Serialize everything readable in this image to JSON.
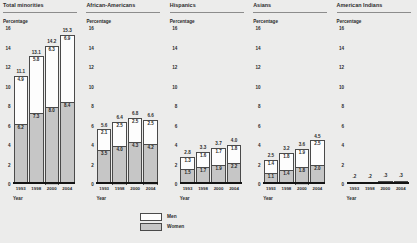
{
  "legend": {
    "items": [
      {
        "label": "Men",
        "color": "#fdfdfd"
      },
      {
        "label": "Women",
        "color": "#c6c6c6"
      }
    ]
  },
  "axis": {
    "y_title": "Percentage",
    "x_title": "Year",
    "yticks": [
      "16",
      "14",
      "12",
      "10",
      "8",
      "6",
      "4",
      "2",
      "0"
    ],
    "ylim": [
      0,
      16
    ],
    "categories": [
      "1993",
      "1998",
      "2000",
      "2004"
    ]
  },
  "chart_data": {
    "type": "bar",
    "title": "",
    "xlabel": "Year",
    "ylabel": "Percentage",
    "ylim": [
      0,
      16
    ],
    "grid": false,
    "legend_position": "bottom-center",
    "stacked": true,
    "categories": [
      "1993",
      "1998",
      "2000",
      "2004"
    ],
    "panels": [
      {
        "title": "Total minorities",
        "totals": [
          11.1,
          13.1,
          14.2,
          15.3
        ],
        "total_labels": [
          "11.1",
          "13.1",
          "14.2",
          "15.3"
        ],
        "series": [
          {
            "name": "Men",
            "values": [
              4.9,
              5.8,
              6.3,
              6.9
            ],
            "labels": [
              "4.9",
              "5.8",
              "6.3",
              "6.9"
            ]
          },
          {
            "name": "Women",
            "values": [
              6.2,
              7.3,
              8.0,
              8.4
            ],
            "labels": [
              "6.2",
              "7.3",
              "8.0",
              "8.4"
            ]
          }
        ]
      },
      {
        "title": "African-Americans",
        "totals": [
          5.6,
          6.4,
          6.8,
          6.6
        ],
        "total_labels": [
          "5.6",
          "6.4",
          "6.8",
          "6.6"
        ],
        "series": [
          {
            "name": "Men",
            "values": [
              2.1,
              2.5,
              2.5,
              2.5
            ],
            "labels": [
              "2.1",
              "2.5",
              "2.5",
              "2.5"
            ]
          },
          {
            "name": "Women",
            "values": [
              3.5,
              4.0,
              4.3,
              4.2
            ],
            "labels": [
              "3.5",
              "4.0",
              "4.3",
              "4.2"
            ]
          }
        ]
      },
      {
        "title": "Hispanics",
        "totals": [
          2.8,
          3.3,
          3.7,
          4.0
        ],
        "total_labels": [
          "2.8",
          "3.3",
          "3.7",
          "4.0"
        ],
        "series": [
          {
            "name": "Men",
            "values": [
              1.3,
              1.6,
              1.7,
              1.8
            ],
            "labels": [
              "1.3",
              "1.6",
              "1.7",
              "1.8"
            ]
          },
          {
            "name": "Women",
            "values": [
              1.5,
              1.7,
              1.9,
              2.2
            ],
            "labels": [
              "1.5",
              "1.7",
              "1.9",
              "2.2"
            ]
          }
        ]
      },
      {
        "title": "Asians",
        "totals": [
          2.5,
          3.2,
          3.6,
          4.5
        ],
        "total_labels": [
          "2.5",
          "3.2",
          "3.6",
          "4.5"
        ],
        "series": [
          {
            "name": "Men",
            "values": [
              1.4,
              1.8,
              1.9,
              2.5
            ],
            "labels": [
              "1.4",
              "1.8",
              "1.9",
              "2.5"
            ]
          },
          {
            "name": "Women",
            "values": [
              1.1,
              1.4,
              1.8,
              2.0
            ],
            "labels": [
              "1.1",
              "1.4",
              "1.8",
              "2.0"
            ]
          }
        ]
      },
      {
        "title": "American Indians",
        "totals": [
          0.2,
          0.2,
          0.3,
          0.3
        ],
        "total_labels": [
          ".2",
          ".2",
          ".3",
          ".3"
        ],
        "series": [
          {
            "name": "Men",
            "values": [
              0.1,
              0.1,
              0.15,
              0.15
            ],
            "labels": [
              "",
              "",
              "",
              ""
            ]
          },
          {
            "name": "Women",
            "values": [
              0.1,
              0.1,
              0.15,
              0.15
            ],
            "labels": [
              "",
              "",
              "",
              ""
            ]
          }
        ]
      }
    ]
  }
}
